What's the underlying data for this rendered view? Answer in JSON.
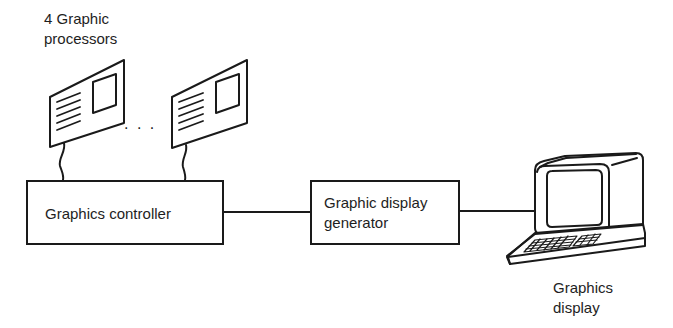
{
  "diagram": {
    "type": "block-diagram",
    "nodes": {
      "processors": {
        "label_line1": "4 Graphic",
        "label_line2": "processors",
        "ellipsis": ". . ."
      },
      "controller": {
        "label": "Graphics controller"
      },
      "generator": {
        "label_line1": "Graphic display",
        "label_line2": "generator"
      },
      "display": {
        "label_line1": "Graphics",
        "label_line2": "display"
      }
    },
    "edges": [
      {
        "from": "processors",
        "to": "controller",
        "style": "wavy-cable"
      },
      {
        "from": "controller",
        "to": "generator",
        "style": "line"
      },
      {
        "from": "generator",
        "to": "display",
        "style": "line"
      }
    ],
    "colors": {
      "stroke": "#1a1a1a",
      "background": "#ffffff"
    }
  }
}
